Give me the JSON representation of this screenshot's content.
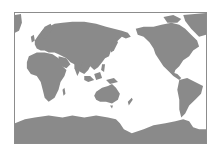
{
  "map": {
    "projection": "Pacific-centered world map",
    "colors": {
      "land": "#8a8a8a",
      "ocean": "#ffffff",
      "border": "#8c8c8c"
    },
    "regions": [
      "Europe",
      "Africa",
      "Asia",
      "Australia",
      "North America",
      "South America",
      "Greenland",
      "Antarctica",
      "Indonesia",
      "Japan",
      "New Zealand"
    ]
  }
}
